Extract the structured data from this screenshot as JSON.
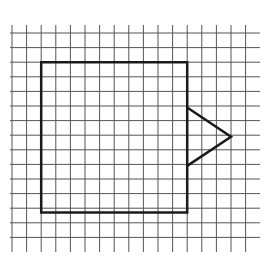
{
  "diagram": {
    "description": "Square on a grid with a triangle attached to its right side",
    "colors": {
      "background": "#ffffff",
      "grid_line": "#555555",
      "shape_line": "#1a1a1a"
    },
    "grid": {
      "origin_x": 12,
      "origin_y": 33,
      "cell_size": 14.6,
      "columns": 16,
      "rows": 15,
      "vertical_line_top": 25,
      "vertical_line_bottom": 252,
      "horizontal_line_left": 10,
      "horizontal_line_right": 260
    },
    "shapes": [
      {
        "name": "square",
        "type": "polygon",
        "grid_points": [
          [
            2,
            2
          ],
          [
            12,
            2
          ],
          [
            12,
            12.3
          ],
          [
            2,
            12.3
          ]
        ],
        "stroke_width": 2.5
      },
      {
        "name": "triangle",
        "type": "polyline",
        "grid_points": [
          [
            12,
            5.1
          ],
          [
            15,
            7.1
          ],
          [
            12,
            9.1
          ]
        ],
        "stroke_width": 2.5
      }
    ]
  }
}
